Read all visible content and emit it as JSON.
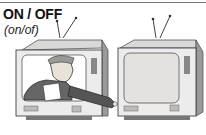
{
  "heading": {
    "word": "ON / OFF",
    "pronunciation": "(on/of)"
  },
  "illustration": {
    "description": "Man inside left TV set reaching out to press a button on the right TV set; right TV screen is blank",
    "left_tv": {
      "state": "on",
      "content": "man-holding-paper"
    },
    "right_tv": {
      "state": "off",
      "content": "blank-screen"
    }
  }
}
